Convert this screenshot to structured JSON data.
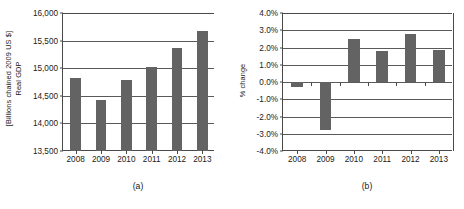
{
  "figure": {
    "background": "#ffffff",
    "bar_color": "#636363",
    "axis_color": "#4a4a4a",
    "grid_color": "#5a5a5a"
  },
  "panel_a": {
    "caption": "(a)",
    "ylabel_line1": "Real GDP",
    "ylabel_line2": "[Billions chained 2009 US $]"
  },
  "panel_b": {
    "caption": "(b)",
    "ylabel": "% change"
  },
  "chart_data": [
    {
      "type": "bar",
      "panel": "(a)",
      "title": "",
      "xlabel": "",
      "ylabel": "Real GDP [Billions chained 2009 US $]",
      "categories": [
        "2008",
        "2009",
        "2010",
        "2011",
        "2012",
        "2013"
      ],
      "values": [
        14820,
        14420,
        14780,
        15020,
        15360,
        15670
      ],
      "ylim": [
        13500,
        16000
      ],
      "yticks": [
        13500,
        14000,
        14500,
        15000,
        15500,
        16000
      ],
      "ytick_labels": [
        "13,500",
        "14,000",
        "14,500",
        "15,000",
        "15,500",
        "16,000"
      ],
      "grid": true,
      "legend": "none",
      "bar_color": "#636363"
    },
    {
      "type": "bar",
      "panel": "(b)",
      "title": "",
      "xlabel": "",
      "ylabel": "% change",
      "categories": [
        "2008",
        "2009",
        "2010",
        "2011",
        "2012",
        "2013"
      ],
      "values": [
        -0.3,
        -2.8,
        2.5,
        1.8,
        2.8,
        1.85
      ],
      "ylim": [
        -4.0,
        4.0
      ],
      "yticks": [
        -4.0,
        -3.0,
        -2.0,
        -1.0,
        0.0,
        1.0,
        2.0,
        3.0,
        4.0
      ],
      "ytick_labels": [
        "-4.0%",
        "-3.0%",
        "-2.0%",
        "-1.0%",
        "0.0%",
        "1.0%",
        "2.0%",
        "3.0%",
        "4.0%"
      ],
      "grid": true,
      "legend": "none",
      "bar_color": "#636363"
    }
  ]
}
